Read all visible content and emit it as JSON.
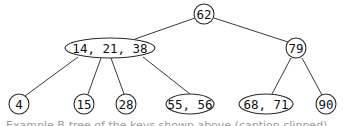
{
  "diagram": {
    "type": "b-tree",
    "nodes": [
      {
        "id": "root",
        "label": "62",
        "shape": "circle",
        "cx": 204,
        "cy": 14,
        "rx": 10,
        "ry": 10
      },
      {
        "id": "n-14-21-38",
        "label": "14, 21, 38",
        "shape": "ellipse",
        "cx": 110,
        "cy": 48,
        "rx": 45,
        "ry": 10
      },
      {
        "id": "n-79",
        "label": "79",
        "shape": "circle",
        "cx": 296,
        "cy": 48,
        "rx": 10,
        "ry": 10
      },
      {
        "id": "n-4",
        "label": "4",
        "shape": "circle",
        "cx": 19,
        "cy": 104,
        "rx": 10,
        "ry": 10
      },
      {
        "id": "n-15",
        "label": "15",
        "shape": "circle",
        "cx": 84,
        "cy": 104,
        "rx": 10,
        "ry": 10
      },
      {
        "id": "n-28",
        "label": "28",
        "shape": "circle",
        "cx": 126,
        "cy": 104,
        "rx": 10,
        "ry": 10
      },
      {
        "id": "n-55-56",
        "label": "55, 56",
        "shape": "ellipse",
        "cx": 190,
        "cy": 104,
        "rx": 24,
        "ry": 10
      },
      {
        "id": "n-68-71",
        "label": "68, 71",
        "shape": "ellipse",
        "cx": 266,
        "cy": 104,
        "rx": 27,
        "ry": 10
      },
      {
        "id": "n-90",
        "label": "90",
        "shape": "circle",
        "cx": 326,
        "cy": 104,
        "rx": 10,
        "ry": 10
      }
    ],
    "edges": [
      {
        "from": "root",
        "to": "n-14-21-38",
        "x1": 195,
        "y1": 18,
        "x2": 135,
        "y2": 39
      },
      {
        "from": "root",
        "to": "n-79",
        "x1": 214,
        "y1": 18,
        "x2": 288,
        "y2": 42
      },
      {
        "from": "n-14-21-38",
        "to": "n-4",
        "x1": 78,
        "y1": 57,
        "x2": 25,
        "y2": 96
      },
      {
        "from": "n-14-21-38",
        "to": "n-15",
        "x1": 101,
        "y1": 58,
        "x2": 88,
        "y2": 94
      },
      {
        "from": "n-14-21-38",
        "to": "n-28",
        "x1": 111,
        "y1": 58,
        "x2": 124,
        "y2": 94
      },
      {
        "from": "n-14-21-38",
        "to": "n-55-56",
        "x1": 143,
        "y1": 57,
        "x2": 190,
        "y2": 94
      },
      {
        "from": "n-79",
        "to": "n-68-71",
        "x1": 291,
        "y1": 58,
        "x2": 272,
        "y2": 94
      },
      {
        "from": "n-79",
        "to": "n-90",
        "x1": 302,
        "y1": 58,
        "x2": 322,
        "y2": 95
      }
    ]
  },
  "caption": {
    "text": "Example B-tree of the keys shown above (caption clipped)"
  }
}
